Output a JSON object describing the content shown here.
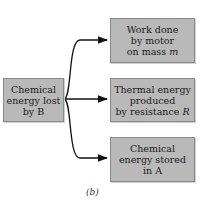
{
  "diagram": {
    "source": {
      "lines": [
        "Chemical",
        "energy lost",
        "by B"
      ]
    },
    "targets": [
      {
        "lines": [
          "Work done",
          "by motor",
          "on mass "
        ],
        "italic_suffix": "m"
      },
      {
        "lines": [
          "Thermal energy",
          "produced",
          "by resistance "
        ],
        "italic_suffix": "R"
      },
      {
        "lines": [
          "Chemical",
          "energy stored",
          "in A"
        ],
        "italic_suffix": ""
      }
    ],
    "caption": "(b)",
    "colors": {
      "box_fill": "#b9b9b9",
      "box_border": "#8a8a8a",
      "arrow": "#111111"
    }
  }
}
